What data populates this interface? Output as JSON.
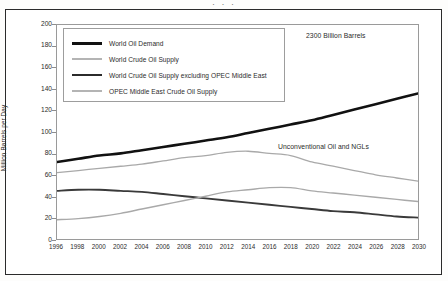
{
  "page": {
    "header_fragment": "· · ·"
  },
  "chart_data": {
    "type": "line",
    "title": "",
    "subtitle": "",
    "xlabel": "",
    "ylabel": "Million Barrels per Day",
    "xlim": [
      1996,
      2030
    ],
    "ylim": [
      0,
      200
    ],
    "grid": false,
    "legend_position": "upper-left-inside",
    "x": [
      1996,
      1998,
      2000,
      2002,
      2004,
      2006,
      2008,
      2010,
      2012,
      2014,
      2016,
      2018,
      2020,
      2022,
      2024,
      2026,
      2028,
      2030
    ],
    "x_tick_labels": [
      "1996",
      "1998",
      "2000",
      "2002",
      "2004",
      "2006",
      "2008",
      "2010",
      "2012",
      "2014",
      "2016",
      "2018",
      "2020",
      "2022",
      "2024",
      "2026",
      "2028",
      "2030"
    ],
    "y_tick_labels": [
      "0",
      "20",
      "40",
      "60",
      "80",
      "100",
      "120",
      "140",
      "160",
      "180",
      "200"
    ],
    "y_ticks": [
      0,
      20,
      40,
      60,
      80,
      100,
      120,
      140,
      160,
      180,
      200
    ],
    "series": [
      {
        "name": "World Oil Demand",
        "color": "#111111",
        "width": 2.6,
        "values": [
          72,
          75,
          78,
          80,
          83,
          86,
          89,
          92,
          95,
          99,
          103,
          107,
          111,
          116,
          121,
          126,
          131,
          136
        ]
      },
      {
        "name": "World Crude Oil Supply",
        "color": "#a9a9a9",
        "width": 1.3,
        "values": [
          62,
          64,
          66,
          68,
          70,
          73,
          76,
          78,
          81,
          82,
          80,
          78,
          72,
          68,
          64,
          60,
          57,
          54
        ]
      },
      {
        "name": "World Crude Oil Supply excluding OPEC Middle East",
        "color": "#3a3a3a",
        "width": 1.9,
        "values": [
          45,
          46,
          46,
          45,
          44,
          42,
          40,
          38,
          36,
          34,
          32,
          30,
          28,
          26,
          25,
          23,
          21,
          20
        ]
      },
      {
        "name": "OPEC Middle East Crude Oil Supply",
        "color": "#a9a9a9",
        "width": 1.4,
        "values": [
          18,
          19,
          21,
          24,
          28,
          32,
          36,
          40,
          44,
          46,
          48,
          48,
          45,
          43,
          41,
          39,
          37,
          35
        ]
      }
    ],
    "annotations": [
      {
        "text": "2300 Billion Barrels",
        "x": 2022,
        "y": 193
      },
      {
        "text": "Unconventional Oil and NGLs",
        "x": 2019,
        "y": 95
      }
    ]
  },
  "legend": {
    "items": [
      {
        "label": "World Oil Demand",
        "color": "#111111",
        "thickness": "3px"
      },
      {
        "label": "World Crude Oil Supply",
        "color": "#b4b4b4",
        "thickness": "1.5px"
      },
      {
        "label": "World Crude Oil Supply excluding OPEC Middle East",
        "color": "#2b2b2b",
        "thickness": "2.4px"
      },
      {
        "label": "OPEC Middle East Crude Oil Supply",
        "color": "#b4b4b4",
        "thickness": "1.5px"
      }
    ]
  }
}
